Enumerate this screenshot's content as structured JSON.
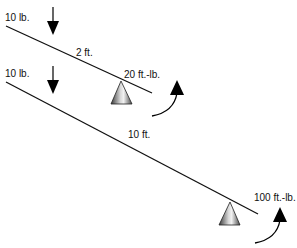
{
  "diagram": {
    "colors": {
      "line": "#111111",
      "arrow": "#000000",
      "fulcrum_dark": "#555555",
      "fulcrum_light": "#e8e8e8"
    },
    "levers": [
      {
        "force_label": "10 lb.",
        "distance_label": "2 ft.",
        "torque_label": "20 ft.-lb.",
        "force_icon": "down-arrow-icon",
        "fulcrum_icon": "fulcrum-cone-icon",
        "rotation_icon": "curved-arrow-icon"
      },
      {
        "force_label": "10 lb.",
        "distance_label": "10 ft.",
        "torque_label": "100 ft.-lb.",
        "force_icon": "down-arrow-icon",
        "fulcrum_icon": "fulcrum-cone-icon",
        "rotation_icon": "curved-arrow-icon"
      }
    ]
  }
}
